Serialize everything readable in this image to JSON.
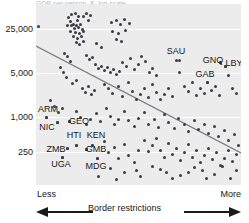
{
  "chart_data": {
    "type": "scatter",
    "title": "",
    "title_sliver_text": "GDP per person, $, log scale",
    "xlabel": "Border restrictions",
    "ylabel": "",
    "x_axis": {
      "left_end_label": "Less",
      "right_end_label": "More",
      "left_arrow_icon": "arrow-left-icon",
      "right_arrow_icon": "arrow-right-icon",
      "ticks": []
    },
    "y_axis": {
      "scale": "log",
      "tick_labels": [
        "25,000",
        "5,000",
        "1,000",
        "250"
      ],
      "tick_values": [
        25000,
        5000,
        1000,
        250
      ],
      "tick_pixel_y": [
        29,
        73,
        117,
        152
      ]
    },
    "grid": {
      "horizontal": true,
      "vertical": false,
      "color": "#ffffff"
    },
    "legend": {
      "visible": false,
      "position": "none"
    },
    "plot_background_color": "#ececec",
    "point_color": "#3b3b44",
    "trendline": {
      "visible": true,
      "color": "#7a7a82",
      "direction": "negative",
      "x1": 0,
      "y1": 42,
      "x2": 205,
      "y2": 149
    },
    "annotations": [
      {
        "label": "SAU",
        "x": 176,
        "y": 51,
        "point_x": 179,
        "point_y": 60
      },
      {
        "label": "GNQ",
        "x": 213,
        "y": 60,
        "point_x": 220,
        "point_y": 62
      },
      {
        "label": "LBY",
        "x": 234,
        "y": 63,
        "point_x": 225,
        "point_y": 66
      },
      {
        "label": "GAB",
        "x": 205,
        "y": 74,
        "point_x": 207,
        "point_y": 82
      },
      {
        "label": "ARM",
        "x": 48,
        "y": 109,
        "point_x": 46,
        "point_y": 117
      },
      {
        "label": "NIC",
        "x": 47,
        "y": 127,
        "point_x": 57,
        "point_y": 122
      },
      {
        "label": "GEO",
        "x": 79,
        "y": 121,
        "point_x": 69,
        "point_y": 121
      },
      {
        "label": "HTI",
        "x": 74,
        "y": 135,
        "point_x": 76,
        "point_y": 145
      },
      {
        "label": "KEN",
        "x": 96,
        "y": 135,
        "point_x": 92,
        "point_y": 145
      },
      {
        "label": "ZMB",
        "x": 56,
        "y": 149,
        "point_x": 67,
        "point_y": 148
      },
      {
        "label": "GMB",
        "x": 96,
        "y": 149,
        "point_x": 86,
        "point_y": 149
      },
      {
        "label": "UGA",
        "x": 61,
        "y": 164,
        "point_x": 62,
        "point_y": 157
      },
      {
        "label": "MDG",
        "x": 96,
        "y": 166,
        "point_x": 97,
        "point_y": 158
      }
    ],
    "points": [
      [
        38,
        26
      ],
      [
        68,
        17
      ],
      [
        70,
        21
      ],
      [
        71,
        14
      ],
      [
        75,
        13
      ],
      [
        77,
        20
      ],
      [
        78,
        16
      ],
      [
        83,
        16
      ],
      [
        86,
        13
      ],
      [
        88,
        20
      ],
      [
        90,
        15
      ],
      [
        67,
        25
      ],
      [
        71,
        25
      ],
      [
        73,
        24
      ],
      [
        74,
        28
      ],
      [
        76,
        25
      ],
      [
        78,
        27
      ],
      [
        80,
        24
      ],
      [
        82,
        29
      ],
      [
        70,
        31
      ],
      [
        75,
        32
      ],
      [
        79,
        33
      ],
      [
        83,
        31
      ],
      [
        73,
        36
      ],
      [
        77,
        38
      ],
      [
        81,
        36
      ],
      [
        76,
        42
      ],
      [
        79,
        44
      ],
      [
        83,
        41
      ],
      [
        111,
        22
      ],
      [
        116,
        20
      ],
      [
        120,
        24
      ],
      [
        124,
        19
      ],
      [
        129,
        23
      ],
      [
        112,
        31
      ],
      [
        118,
        33
      ],
      [
        125,
        30
      ],
      [
        116,
        39
      ],
      [
        121,
        41
      ],
      [
        96,
        43
      ],
      [
        101,
        47
      ],
      [
        64,
        53
      ],
      [
        67,
        56
      ],
      [
        70,
        61
      ],
      [
        86,
        55
      ],
      [
        89,
        59
      ],
      [
        92,
        57
      ],
      [
        95,
        64
      ],
      [
        98,
        68
      ],
      [
        101,
        66
      ],
      [
        104,
        70
      ],
      [
        107,
        67
      ],
      [
        110,
        72
      ],
      [
        113,
        69
      ],
      [
        116,
        74
      ],
      [
        119,
        71
      ],
      [
        122,
        62
      ],
      [
        126,
        66
      ],
      [
        130,
        58
      ],
      [
        134,
        69
      ],
      [
        138,
        64
      ],
      [
        141,
        56
      ],
      [
        145,
        61
      ],
      [
        149,
        72
      ],
      [
        152,
        68
      ],
      [
        156,
        75
      ],
      [
        60,
        67
      ],
      [
        63,
        72
      ],
      [
        66,
        77
      ],
      [
        72,
        83
      ],
      [
        76,
        80
      ],
      [
        82,
        88
      ],
      [
        85,
        92
      ],
      [
        88,
        86
      ],
      [
        91,
        94
      ],
      [
        94,
        90
      ],
      [
        104,
        84
      ],
      [
        108,
        88
      ],
      [
        112,
        93
      ],
      [
        118,
        86
      ],
      [
        122,
        96
      ],
      [
        128,
        82
      ],
      [
        132,
        91
      ],
      [
        136,
        99
      ],
      [
        140,
        94
      ],
      [
        144,
        88
      ],
      [
        148,
        97
      ],
      [
        152,
        84
      ],
      [
        156,
        92
      ],
      [
        160,
        99
      ],
      [
        164,
        94
      ],
      [
        168,
        88
      ],
      [
        172,
        96
      ],
      [
        176,
        60
      ],
      [
        179,
        72
      ],
      [
        184,
        86
      ],
      [
        188,
        91
      ],
      [
        192,
        82
      ],
      [
        196,
        95
      ],
      [
        200,
        88
      ],
      [
        204,
        93
      ],
      [
        207,
        82
      ],
      [
        211,
        90
      ],
      [
        215,
        86
      ],
      [
        219,
        95
      ],
      [
        220,
        62
      ],
      [
        225,
        66
      ],
      [
        228,
        75
      ],
      [
        232,
        88
      ],
      [
        236,
        93
      ],
      [
        50,
        100
      ],
      [
        54,
        106
      ],
      [
        58,
        112
      ],
      [
        62,
        108
      ],
      [
        46,
        117
      ],
      [
        57,
        122
      ],
      [
        69,
        121
      ],
      [
        76,
        111
      ],
      [
        80,
        117
      ],
      [
        86,
        124
      ],
      [
        90,
        119
      ],
      [
        96,
        113
      ],
      [
        100,
        121
      ],
      [
        106,
        108
      ],
      [
        110,
        116
      ],
      [
        114,
        124
      ],
      [
        118,
        119
      ],
      [
        124,
        111
      ],
      [
        128,
        120
      ],
      [
        134,
        126
      ],
      [
        138,
        118
      ],
      [
        144,
        112
      ],
      [
        148,
        124
      ],
      [
        154,
        119
      ],
      [
        158,
        127
      ],
      [
        164,
        114
      ],
      [
        168,
        122
      ],
      [
        174,
        128
      ],
      [
        178,
        118
      ],
      [
        184,
        124
      ],
      [
        188,
        131
      ],
      [
        194,
        120
      ],
      [
        198,
        129
      ],
      [
        204,
        124
      ],
      [
        208,
        133
      ],
      [
        214,
        126
      ],
      [
        218,
        136
      ],
      [
        224,
        130
      ],
      [
        228,
        140
      ],
      [
        234,
        134
      ],
      [
        238,
        145
      ],
      [
        67,
        148
      ],
      [
        62,
        157
      ],
      [
        76,
        145
      ],
      [
        86,
        149
      ],
      [
        92,
        145
      ],
      [
        97,
        158
      ],
      [
        104,
        141
      ],
      [
        108,
        152
      ],
      [
        114,
        147
      ],
      [
        118,
        158
      ],
      [
        124,
        144
      ],
      [
        128,
        155
      ],
      [
        134,
        162
      ],
      [
        138,
        150
      ],
      [
        144,
        140
      ],
      [
        148,
        151
      ],
      [
        152,
        145
      ],
      [
        156,
        138
      ],
      [
        160,
        150
      ],
      [
        164,
        157
      ],
      [
        168,
        143
      ],
      [
        172,
        154
      ],
      [
        176,
        148
      ],
      [
        180,
        160
      ],
      [
        184,
        152
      ],
      [
        188,
        144
      ],
      [
        192,
        157
      ],
      [
        196,
        150
      ],
      [
        200,
        162
      ],
      [
        204,
        155
      ],
      [
        208,
        148
      ],
      [
        212,
        159
      ],
      [
        216,
        152
      ],
      [
        220,
        165
      ],
      [
        224,
        158
      ],
      [
        228,
        150
      ],
      [
        232,
        161
      ],
      [
        236,
        154
      ],
      [
        110,
        168
      ],
      [
        124,
        172
      ],
      [
        136,
        170
      ],
      [
        152,
        166
      ],
      [
        160,
        169
      ],
      [
        166,
        172
      ],
      [
        180,
        175
      ],
      [
        194,
        167
      ],
      [
        202,
        170
      ],
      [
        214,
        174
      ],
      [
        222,
        166
      ],
      [
        230,
        178
      ],
      [
        98,
        176
      ],
      [
        116,
        179
      ],
      [
        140,
        176
      ],
      [
        172,
        178
      ],
      [
        188,
        172
      ],
      [
        206,
        178
      ],
      [
        236,
        170
      ]
    ]
  }
}
